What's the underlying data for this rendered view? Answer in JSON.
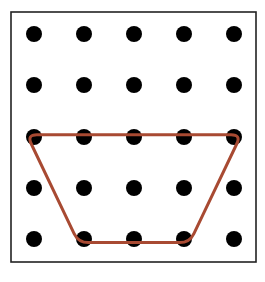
{
  "diagram": {
    "type": "geoboard",
    "grid": {
      "rows": 5,
      "cols": 5,
      "x": [
        34,
        84,
        134,
        184,
        234
      ],
      "y": [
        34,
        85,
        137,
        188,
        239
      ],
      "dot_radius": 8,
      "dot_color": "#000000"
    },
    "frame": {
      "x": 11,
      "y": 12,
      "width": 245,
      "height": 250,
      "stroke": "#222222"
    },
    "shape": {
      "name": "trapezoid",
      "stroke": "#a84a32",
      "vertices_grid": [
        [
          0,
          2
        ],
        [
          4,
          2
        ],
        [
          3,
          4
        ],
        [
          1,
          4
        ]
      ]
    }
  }
}
